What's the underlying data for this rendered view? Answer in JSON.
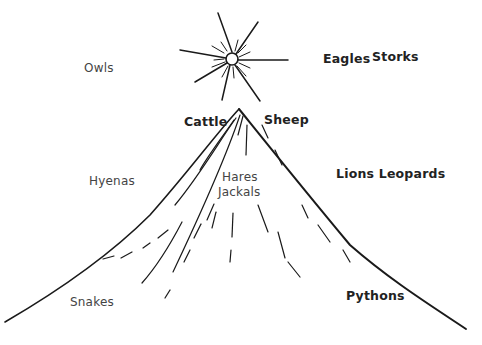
{
  "diagram": {
    "title": "",
    "labels": {
      "owls": "Owls",
      "eagles": "Eagles",
      "storks": "Storks",
      "cattle": "Cattle",
      "sheep": "Sheep",
      "hyenas": "Hyenas",
      "hares": "Hares",
      "jackals": "Jackals",
      "lions_leopards": "Lions Leopards",
      "snakes": "Snakes",
      "pythons": "Pythons"
    },
    "elements": [
      "sun",
      "mountain"
    ],
    "colors": {
      "ink": "#1a1a1a",
      "background": "#ffffff"
    }
  }
}
